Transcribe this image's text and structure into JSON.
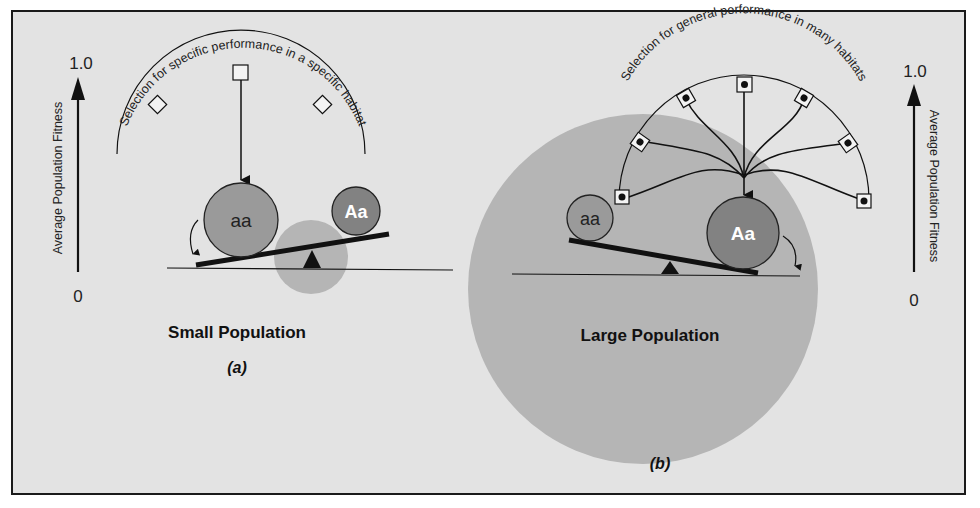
{
  "colors": {
    "page_bg": "#ffffff",
    "panel_bg": "#e3e3e3",
    "frame": "#1a1a1a",
    "population_circle": "#b5b5b5",
    "allele_aa": "#9a9a9a",
    "allele_Aa": "#828282",
    "ink": "#111111",
    "label_white": "#ffffff"
  },
  "panel_a": {
    "axis": {
      "top_label": "1.0",
      "bottom_label": "0",
      "title": "Average Population Fitness"
    },
    "arc_label": "Selection for specific performance in a specific habitat",
    "genotype_left": "aa",
    "genotype_right": "Aa",
    "population_label": "Small Population",
    "panel_label": "(a)"
  },
  "panel_b": {
    "axis": {
      "top_label": "1.0",
      "bottom_label": "0",
      "title": "Average Population Fitness"
    },
    "arc_label": "Selection for general performance in many habitats",
    "genotype_left": "aa",
    "genotype_right": "Aa",
    "population_label": "Large Population",
    "panel_label": "(b)"
  }
}
